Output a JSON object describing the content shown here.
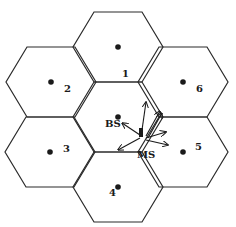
{
  "diagram": {
    "cells": [
      {
        "id": "center",
        "label": ""
      },
      {
        "id": "1",
        "label": "1"
      },
      {
        "id": "2",
        "label": "2"
      },
      {
        "id": "3",
        "label": "3"
      },
      {
        "id": "4",
        "label": "4"
      },
      {
        "id": "5",
        "label": "5"
      },
      {
        "id": "6",
        "label": "6"
      }
    ],
    "base_station_label": "BS",
    "mobile_station_label": "MS",
    "colors": {
      "stroke": "#2a2a2a",
      "fill": "#ffffff"
    }
  }
}
